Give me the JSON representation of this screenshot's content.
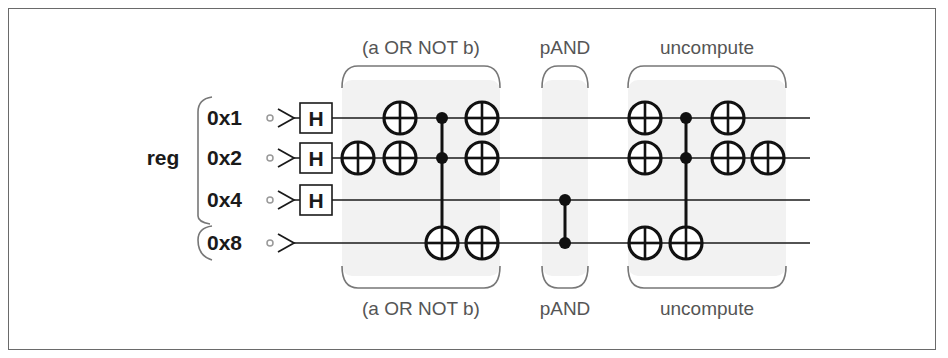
{
  "register": {
    "name": "reg",
    "qubits": [
      {
        "label": "0x1",
        "y": 118,
        "hadamard": true
      },
      {
        "label": "0x2",
        "y": 158,
        "hadamard": true
      },
      {
        "label": "0x4",
        "y": 200,
        "hadamard": true
      },
      {
        "label": "0x8",
        "y": 243,
        "hadamard": false
      }
    ],
    "hadamard_label": "H"
  },
  "wire_start_x": 300,
  "wire_end_x": 810,
  "sections": [
    {
      "label_top": "(a OR NOT b)",
      "label_bottom": "(a OR NOT b)",
      "x0": 342,
      "x1": 500,
      "cx": 421
    },
    {
      "label_top": "pAND",
      "label_bottom": "pAND",
      "x0": 542,
      "x1": 588,
      "cx": 565
    },
    {
      "label_top": "uncompute",
      "label_bottom": "uncompute",
      "x0": 628,
      "x1": 786,
      "cx": 707
    }
  ],
  "gates": [
    {
      "type": "not",
      "x": 358,
      "rows": [
        1
      ]
    },
    {
      "type": "not",
      "x": 400,
      "rows": [
        0,
        1
      ]
    },
    {
      "type": "cnot",
      "x": 442,
      "controls": [
        0,
        1
      ],
      "target": 3
    },
    {
      "type": "not",
      "x": 482,
      "rows": [
        0,
        1,
        3
      ]
    },
    {
      "type": "cz",
      "x": 565,
      "controls": [
        2,
        3
      ]
    },
    {
      "type": "not",
      "x": 645,
      "rows": [
        0,
        1,
        3
      ]
    },
    {
      "type": "cnot",
      "x": 686,
      "controls": [
        0,
        1
      ],
      "target": 3
    },
    {
      "type": "not",
      "x": 728,
      "rows": [
        0,
        1
      ]
    },
    {
      "type": "not",
      "x": 768,
      "rows": [
        1
      ]
    }
  ],
  "colors": {
    "wire": "#1a1a1a",
    "label": "#555555",
    "section_fill": "#f2f2f2",
    "brace": "#777777",
    "border": "#6a6a6a"
  }
}
